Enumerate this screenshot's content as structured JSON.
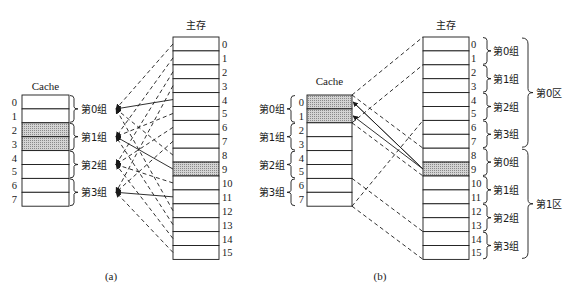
{
  "colors": {
    "line": "#1a1a1a",
    "shade": "#b8b8b8",
    "background": "#ffffff"
  },
  "diagram_a": {
    "caption": "(a)",
    "cache_title": "Cache",
    "memory_title": "主存",
    "cache_rows": [
      "0",
      "1",
      "2",
      "3",
      "4",
      "5",
      "6",
      "7"
    ],
    "cache_shaded_rows": [
      2,
      3
    ],
    "cache_groups": [
      "第0组",
      "第1组",
      "第2组",
      "第3组"
    ],
    "memory_rows": [
      "0",
      "1",
      "2",
      "3",
      "4",
      "5",
      "6",
      "7",
      "8",
      "9",
      "10",
      "11",
      "12",
      "13",
      "14",
      "15"
    ],
    "memory_shaded_rows": [
      9
    ],
    "mapping_note": "Each main-memory block j maps to cache group (j mod 4); block 9 shown with solid arrows to group 1"
  },
  "diagram_b": {
    "caption": "(b)",
    "cache_title": "Cache",
    "memory_title": "主存",
    "cache_rows": [
      "0",
      "1",
      "2",
      "3",
      "4",
      "5",
      "6",
      "7"
    ],
    "cache_shaded_rows": [
      0,
      1
    ],
    "cache_groups": [
      "第0组",
      "第1组",
      "第2组",
      "第3组"
    ],
    "memory_rows": [
      "0",
      "1",
      "2",
      "3",
      "4",
      "5",
      "6",
      "7",
      "8",
      "9",
      "10",
      "11",
      "12",
      "13",
      "14",
      "15"
    ],
    "memory_shaded_rows": [
      9
    ],
    "memory_groups": [
      "第0组",
      "第1组",
      "第2组",
      "第3组",
      "第0组",
      "第1组",
      "第2组",
      "第3组"
    ],
    "memory_zones": [
      "第0区",
      "第1区"
    ]
  }
}
